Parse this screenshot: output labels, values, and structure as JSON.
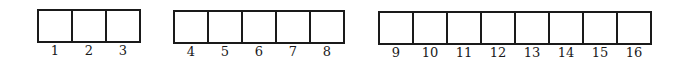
{
  "diagram": {
    "groups": [
      {
        "left": 37,
        "top": 9,
        "cell_width": 36,
        "cell_height": 34,
        "cells": [
          "1",
          "2",
          "3"
        ]
      },
      {
        "left": 173,
        "top": 10,
        "cell_width": 36,
        "cell_height": 34,
        "cells": [
          "4",
          "5",
          "6",
          "7",
          "8"
        ]
      },
      {
        "left": 378,
        "top": 11,
        "cell_width": 36,
        "cell_height": 34,
        "cells": [
          "9",
          "10",
          "11",
          "12",
          "13",
          "14",
          "15",
          "16"
        ]
      }
    ],
    "line_color": "#1a1a1a",
    "background": "#ffffff"
  }
}
